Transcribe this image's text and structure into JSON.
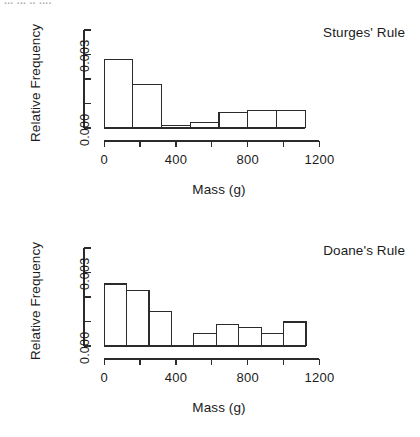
{
  "figure": {
    "artifact_text": "... ... .. ....",
    "stroke_color": "#2b2b2b",
    "text_color": "#1b1b1b",
    "background": "#ffffff"
  },
  "chart_data": [
    {
      "type": "bar",
      "title": "Sturges' Rule",
      "xlabel": "Mass (g)",
      "ylabel": "Relative Frequency",
      "xlim": [
        -40,
        1320
      ],
      "ylim": [
        0.0,
        0.0042
      ],
      "grid": false,
      "legend": "none",
      "x_ticks": [
        0,
        200,
        400,
        600,
        800,
        1000,
        1200
      ],
      "x_tick_labels": [
        "0",
        "",
        "400",
        "",
        "800",
        "",
        "1200"
      ],
      "y_ticks": [
        0.0,
        0.001,
        0.002,
        0.003,
        0.004
      ],
      "y_tick_labels": [
        "0.000",
        "",
        "",
        "0.003",
        ""
      ],
      "bin_width": 160,
      "bin_edges": [
        0,
        160,
        320,
        480,
        640,
        800,
        960,
        1120
      ],
      "categories": [
        "0-160",
        "160-320",
        "320-480",
        "480-640",
        "640-800",
        "800-960",
        "960-1120"
      ],
      "values": [
        0.00279,
        0.00178,
        0.00012,
        0.00022,
        0.00063,
        0.0007,
        0.0007
      ]
    },
    {
      "type": "bar",
      "title": "Doane's Rule",
      "xlabel": "Mass (g)",
      "ylabel": "Relative Frequency",
      "xlim": [
        -40,
        1320
      ],
      "ylim": [
        0.0,
        0.0042
      ],
      "grid": false,
      "legend": "none",
      "x_ticks": [
        0,
        200,
        400,
        600,
        800,
        1000,
        1200
      ],
      "x_tick_labels": [
        "0",
        "",
        "400",
        "",
        "800",
        "",
        "1200"
      ],
      "y_ticks": [
        0.0,
        0.001,
        0.002,
        0.003,
        0.004
      ],
      "y_tick_labels": [
        "0.000",
        "",
        "",
        "0.003",
        ""
      ],
      "bin_width": 125,
      "bin_edges": [
        0,
        125,
        250,
        375,
        500,
        625,
        750,
        875,
        1000,
        1125
      ],
      "categories": [
        "0-125",
        "125-250",
        "250-375",
        "375-500",
        "500-625",
        "625-750",
        "750-875",
        "875-1000",
        "1000-1125"
      ],
      "values": [
        0.00253,
        0.00228,
        0.0014,
        0.0,
        0.00052,
        0.00088,
        0.00077,
        0.0005,
        0.00098
      ]
    }
  ]
}
